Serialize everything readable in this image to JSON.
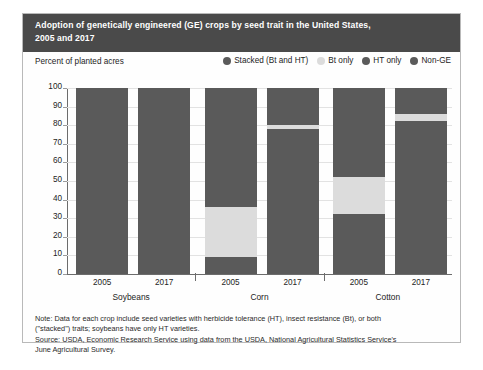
{
  "figure": {
    "title_line1": "Adoption of genetically engineered (GE) crops by seed trait in the United States,",
    "title_line2": "2005 and 2017",
    "axis_label": "Percent of planted acres",
    "notes": [
      "Note: Data for each crop include seed varieties with herbicide tolerance (HT), insect resistance (Bt), or both",
      "(\"stacked\") traits; soybeans have only HT varieties.",
      "Source: USDA, Economic Research Service using data from the USDA, National Agricultural Statistics Service's",
      "June Agricultural Survey."
    ]
  },
  "colors": {
    "title_band": "#4a4a4a",
    "stacked": "#5a5a5a",
    "bt_only": "#dcdcdc",
    "ht_only": "#5a5a5a",
    "non_ge": "#5a5a5a",
    "grid": "#e2e2e2",
    "axis": "#6c6c6c"
  },
  "chart_data": {
    "type": "bar",
    "title": "Adoption of genetically engineered (GE) crops by seed trait in the United States, 2005 and 2017",
    "xlabel": "",
    "ylabel": "Percent of planted acres",
    "ylim": [
      0,
      100
    ],
    "yticks": [
      0,
      10,
      20,
      30,
      40,
      50,
      60,
      70,
      80,
      90,
      100
    ],
    "grid": true,
    "stacked": true,
    "legend_position": "top-right",
    "legend": [
      {
        "name": "Stacked (Bt and HT)",
        "color": "#5a5a5a"
      },
      {
        "name": "Bt only",
        "color": "#dcdcdc"
      },
      {
        "name": "HT only",
        "color": "#5a5a5a"
      },
      {
        "name": "Non-GE",
        "color": "#5a5a5a"
      }
    ],
    "groups": [
      "Soybeans",
      "Corn",
      "Cotton"
    ],
    "categories": [
      "2005",
      "2017",
      "2005",
      "2017",
      "2005",
      "2017"
    ],
    "bars": [
      {
        "group": "Soybeans",
        "year": "2005",
        "segments": [
          {
            "series": "HT only",
            "from": 0,
            "to": 87,
            "value": 87,
            "color": "#5a5a5a"
          },
          {
            "series": "Non-GE",
            "from": 87,
            "to": 100,
            "value": 13,
            "color": "#5a5a5a"
          }
        ]
      },
      {
        "group": "Soybeans",
        "year": "2017",
        "segments": [
          {
            "series": "HT only",
            "from": 0,
            "to": 94,
            "value": 94,
            "color": "#5a5a5a"
          },
          {
            "series": "Non-GE",
            "from": 94,
            "to": 100,
            "value": 6,
            "color": "#5a5a5a"
          }
        ]
      },
      {
        "group": "Corn",
        "year": "2005",
        "segments": [
          {
            "series": "Stacked (Bt and HT)",
            "from": 0,
            "to": 9,
            "value": 9,
            "color": "#5a5a5a"
          },
          {
            "series": "Bt only",
            "from": 9,
            "to": 36,
            "value": 27,
            "color": "#dcdcdc"
          },
          {
            "series": "HT only + Non-GE",
            "from": 36,
            "to": 100,
            "value": 64,
            "color": "#5a5a5a"
          }
        ]
      },
      {
        "group": "Corn",
        "year": "2017",
        "segments": [
          {
            "series": "Stacked (Bt and HT)",
            "from": 0,
            "to": 78,
            "value": 78,
            "color": "#5a5a5a"
          },
          {
            "series": "Bt only",
            "from": 78,
            "to": 80,
            "value": 2,
            "color": "#dcdcdc"
          },
          {
            "series": "HT only + Non-GE",
            "from": 80,
            "to": 100,
            "value": 20,
            "color": "#5a5a5a"
          }
        ]
      },
      {
        "group": "Cotton",
        "year": "2005",
        "segments": [
          {
            "series": "Stacked (Bt and HT)",
            "from": 0,
            "to": 32,
            "value": 32,
            "color": "#5a5a5a"
          },
          {
            "series": "Bt only",
            "from": 32,
            "to": 52,
            "value": 20,
            "color": "#dcdcdc"
          },
          {
            "series": "HT only + Non-GE",
            "from": 52,
            "to": 100,
            "value": 48,
            "color": "#5a5a5a"
          }
        ]
      },
      {
        "group": "Cotton",
        "year": "2017",
        "segments": [
          {
            "series": "Stacked (Bt and HT)",
            "from": 0,
            "to": 82,
            "value": 82,
            "color": "#5a5a5a"
          },
          {
            "series": "Bt only",
            "from": 82,
            "to": 86,
            "value": 4,
            "color": "#dcdcdc"
          },
          {
            "series": "HT only + Non-GE",
            "from": 86,
            "to": 100,
            "value": 14,
            "color": "#5a5a5a"
          }
        ]
      }
    ]
  }
}
